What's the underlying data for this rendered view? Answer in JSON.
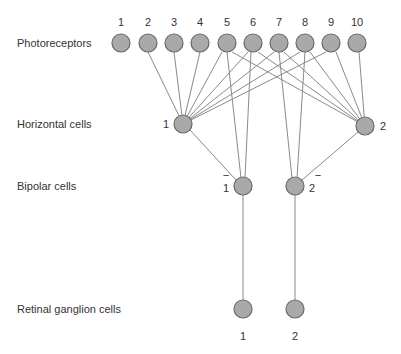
{
  "row_labels": {
    "photoreceptors": "Photoreceptors",
    "horizontal": "Horizontal cells",
    "bipolar": "Bipolar cells",
    "ganglion": "Retinal ganglion cells"
  },
  "photoreceptors": [
    {
      "id": "1",
      "x": 121
    },
    {
      "id": "2",
      "x": 148
    },
    {
      "id": "3",
      "x": 174
    },
    {
      "id": "4",
      "x": 200
    },
    {
      "id": "5",
      "x": 227
    },
    {
      "id": "6",
      "x": 253
    },
    {
      "id": "7",
      "x": 279
    },
    {
      "id": "8",
      "x": 305
    },
    {
      "id": "9",
      "x": 331
    },
    {
      "id": "10",
      "x": 357
    }
  ],
  "horizontal_cells": [
    {
      "id": "1",
      "x": 183,
      "y": 124
    },
    {
      "id": "2",
      "x": 365,
      "y": 126
    }
  ],
  "bipolar_cells": [
    {
      "id": "1",
      "label": "1",
      "sign": "−",
      "x": 243,
      "y": 186
    },
    {
      "id": "2",
      "label": "2",
      "sign": "−",
      "x": 295,
      "y": 186
    }
  ],
  "ganglion_cells": [
    {
      "id": "1",
      "x": 243,
      "y": 309
    },
    {
      "id": "2",
      "x": 295,
      "y": 309
    }
  ],
  "colors": {
    "cell_fill": "#a9a9a9",
    "cell_stroke": "#6a6a6a",
    "line": "#8a8a8a",
    "text": "#333333"
  }
}
